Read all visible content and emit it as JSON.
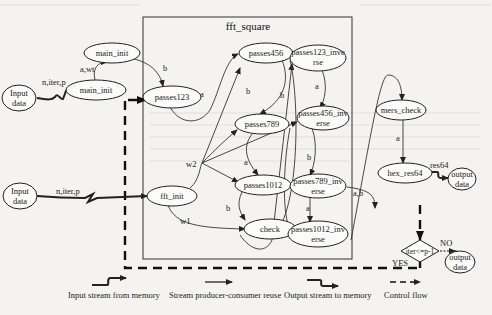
{
  "diagram": {
    "subgraph_title": "fft_square",
    "nodes": {
      "input_data_1": [
        "Input",
        "data"
      ],
      "main_init_top": "main_init",
      "main_init_low": "main_init",
      "passes123": "passes123",
      "passes456": "passes456",
      "passes789": "passes789",
      "passes1012": "passes1012",
      "fft_init": "fft_init",
      "check": "check",
      "passes123_inverse": [
        "passes123_inve",
        "rse"
      ],
      "passes456_inverse": [
        "passes456_inv",
        "erse"
      ],
      "passes789_inverse": [
        "passes789_inv",
        "erse"
      ],
      "passes1012_inverse": [
        "passes1012_inv",
        "erse"
      ],
      "mers_check": "mers_check",
      "hex_res64": "hex_res64",
      "output_data_1": [
        "output",
        "data"
      ],
      "input_data_2": [
        "Input",
        "data"
      ],
      "decision": "iter<=p-1",
      "output_data_2": [
        "output",
        "data"
      ]
    },
    "edge_labels": {
      "in1_stream": "n,iter,p",
      "main_init_awt": "a,wt",
      "main_init_b": "b",
      "p123_a": "a",
      "p456_b": "b",
      "p789_a": "a",
      "p1012_b": "b",
      "w2": "w2",
      "w1": "w1",
      "inv_b": "b",
      "inv123_a": "a",
      "inv456_b": "b",
      "inv789_a": "a",
      "ab": "a,b",
      "in2_stream": "n,iter,p",
      "mers_a": "a",
      "res64": "res64",
      "no": "NO",
      "yes": "YES"
    },
    "legend": [
      {
        "icon": "input-stream-icon",
        "label": "Input stream from memory"
      },
      {
        "icon": "stream-reuse-icon",
        "label": "Stream producer-consumer reuse"
      },
      {
        "icon": "output-stream-icon",
        "label": "Output stream to memory"
      },
      {
        "icon": "control-flow-icon",
        "label": "Control flow"
      }
    ]
  }
}
